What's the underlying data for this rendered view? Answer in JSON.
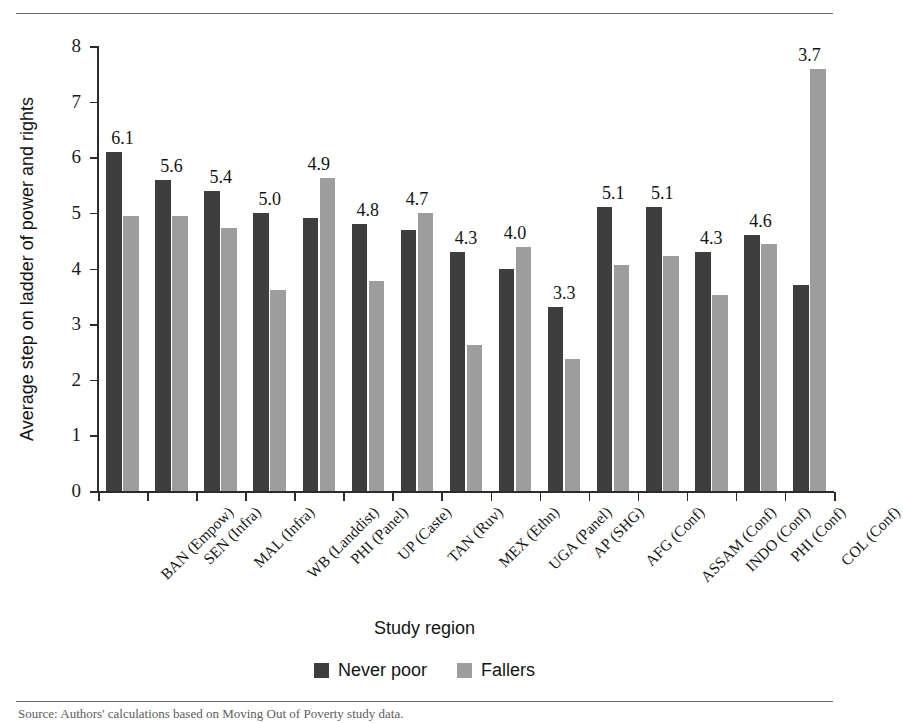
{
  "figure": {
    "title": "Comparison of never poor and fallers on power and rights",
    "caption": "Source: Authors' calculations based on Moving Out of Poverty study data.",
    "x_axis_title": "Study region",
    "y_axis_title": "Average step on ladder of power and rights"
  },
  "colors": {
    "never_poor": "#3e3e3e",
    "fallers": "#9d9d9d",
    "axis": "#2b2b2b",
    "rule": "#6a6a6a"
  },
  "chart_data": {
    "type": "bar",
    "title": "Comparison of never poor and fallers on power and rights",
    "xlabel": "Study region",
    "ylabel": "Average step on ladder of power and rights",
    "ylim": [
      0,
      8
    ],
    "yticks": [
      0,
      1,
      2,
      3,
      4,
      5,
      6,
      7,
      8
    ],
    "grid": false,
    "legend_position": "bottom-center",
    "categories": [
      "BAN (Empow)",
      "SEN (Infra)",
      "MAL (Infra)",
      "WB (Landdist)",
      "PHI (Panel)",
      "UP (Caste)",
      "TAN (Ruv)",
      "MEX (Ethn)",
      "UGA (Panel)",
      "AP (SHG)",
      "AFG (Conf)",
      "ASSAM (Conf)",
      "INDO (Conf)",
      "PHI (Conf)",
      "COL (Conf)"
    ],
    "series": [
      {
        "name": "Never poor",
        "color": "#3e3e3e",
        "values": [
          6.1,
          5.6,
          5.4,
          5.0,
          4.9,
          4.8,
          4.7,
          4.3,
          4.0,
          3.3,
          5.1,
          5.1,
          4.3,
          4.6,
          3.7
        ]
      },
      {
        "name": "Fallers",
        "color": "#9d9d9d",
        "values": [
          4.95,
          4.95,
          4.72,
          3.62,
          5.63,
          3.78,
          5.0,
          2.62,
          4.38,
          2.38,
          4.07,
          4.22,
          3.52,
          4.44,
          7.58
        ]
      }
    ],
    "data_labels": [
      "6.1",
      "5.6",
      "5.4",
      "5.0",
      "4.9",
      "4.8",
      "4.7",
      "4.3",
      "4.0",
      "3.3",
      "5.1",
      "5.1",
      "4.3",
      "4.6",
      "3.7"
    ],
    "data_labels_series": "Never poor"
  },
  "legend": {
    "items": [
      {
        "label": "Never poor",
        "color": "#3e3e3e"
      },
      {
        "label": "Fallers",
        "color": "#9d9d9d"
      }
    ]
  }
}
